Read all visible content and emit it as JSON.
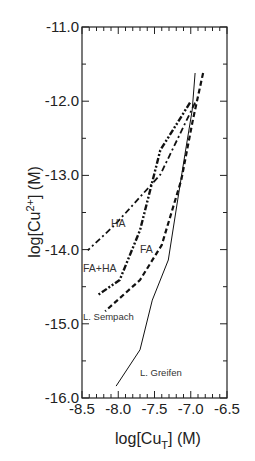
{
  "chart_data": {
    "type": "line",
    "title": "",
    "xlabel": "log[Cu_T] (M)",
    "ylabel": "log[Cu2+] (M)",
    "xlim": [
      -8.5,
      -6.5
    ],
    "ylim": [
      -16.0,
      -11.0
    ],
    "grid": false,
    "legend": "none (inline annotations)",
    "x_ticks": [
      "-8.5",
      "-8.0",
      "-7.5",
      "-7.0",
      "-6.5"
    ],
    "y_ticks": [
      "-11.0",
      "-12.0",
      "-13.0",
      "-14.0",
      "-15.0",
      "-16.0"
    ],
    "series": [
      {
        "name": "L. Greifen",
        "style": "solid",
        "x": [
          -6.94,
          -6.98,
          -7.08,
          -7.18,
          -7.31,
          -7.53,
          -7.7,
          -8.03
        ],
        "y": [
          -11.62,
          -12.12,
          -12.72,
          -13.33,
          -14.14,
          -14.68,
          -15.35,
          -15.84
        ]
      },
      {
        "name": "L. Sempach",
        "style": "dashed",
        "x": [
          -6.83,
          -6.97,
          -7.13,
          -7.4,
          -7.7,
          -8.18
        ],
        "y": [
          -11.62,
          -12.25,
          -13.06,
          -13.94,
          -14.41,
          -14.83
        ]
      },
      {
        "name": "FA",
        "style": "dash-dot-dot (heavy)",
        "x": [
          -7.01,
          -7.42,
          -7.7,
          -7.98,
          -8.28
        ],
        "y": [
          -12.02,
          -12.66,
          -13.74,
          -14.41,
          -14.61
        ]
      },
      {
        "name": "HA",
        "style": "dash-dot",
        "x": [
          -6.94,
          -7.42,
          -8.05,
          -8.42
        ],
        "y": [
          -12.02,
          -12.99,
          -13.67,
          -14.01
        ]
      }
    ],
    "annotations": [
      {
        "text": "HA",
        "x": -8.1,
        "y": -13.7
      },
      {
        "text": "FA",
        "x": -7.7,
        "y": -14.05
      },
      {
        "text": "FA+HA",
        "x": -8.5,
        "y": -14.3
      },
      {
        "text": "L. Sempach",
        "x": -8.5,
        "y": -14.95
      },
      {
        "text": "L. Greifen",
        "x": -7.7,
        "y": -15.7
      }
    ]
  },
  "labels": {
    "y_title_main": "log[Cu",
    "y_title_sup": "2+",
    "y_title_end": "] (M)",
    "x_title_main": "log[Cu",
    "x_title_sub": "T",
    "x_title_end": "] (M)"
  }
}
